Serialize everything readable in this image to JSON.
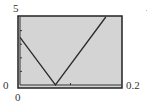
{
  "window": {
    "xmin_label": "0",
    "xmax_label": "0.2",
    "ymin_label": "0",
    "ymax_label": "5"
  },
  "colors": {
    "plot_background": "#d4d4d4",
    "frame": "#222222",
    "curve": "#2a2a2a"
  },
  "chart_data": {
    "type": "line",
    "title": "",
    "xlabel": "",
    "ylabel": "",
    "xlim": [
      0,
      0.2
    ],
    "ylim": [
      0,
      5
    ],
    "grid": false,
    "legend": null,
    "series": [
      {
        "name": "graph",
        "x": [
          0,
          0.07,
          0.17
        ],
        "y": [
          3.5,
          0,
          5
        ]
      }
    ],
    "x_ticks": [
      0.1
    ],
    "y_ticks": [
      1,
      2,
      3,
      4
    ],
    "annotations": [
      "V-shaped (absolute value) graph on graphing calculator window [0, 0.2] x [0, 5]"
    ]
  }
}
